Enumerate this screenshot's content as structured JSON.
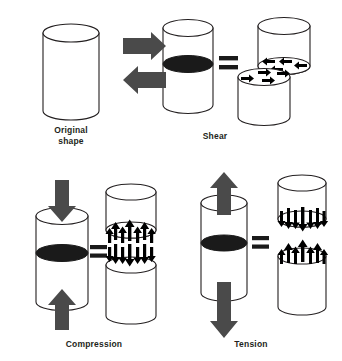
{
  "figure": {
    "title_present": false,
    "background_color": "#ffffff",
    "colors": {
      "outline": "#231f20",
      "fill_cylinder": "#ffffff",
      "stress_plane": "#1a1a1a",
      "load_arrow": "#4a4a4a",
      "force_arrow": "#000000",
      "equals_sign": "#1a1a1a"
    }
  },
  "labels": {
    "original": "Original\nshape",
    "shear": "Shear",
    "compression": "Compression",
    "tension": "Tension",
    "equals": "="
  },
  "panels": [
    {
      "id": "original-shape",
      "label": "Original\nshape",
      "description": "undeformed cylinder, no loads, no internal plane",
      "load_arrows": [],
      "internal_plane": false,
      "split_view": false
    },
    {
      "id": "shear",
      "label": "Shear",
      "description": "opposing horizontal loads offset vertically produce a horizontal shear plane",
      "load_arrows": [
        {
          "name": "shear-load-arrow-right",
          "direction": "right",
          "position": "upper-left-of-cylinder"
        },
        {
          "name": "shear-load-arrow-left",
          "direction": "left",
          "position": "lower-left-of-cylinder"
        }
      ],
      "internal_plane": true,
      "internal_plane_orientation": "horizontal-ellipse-mid-height",
      "split_view": true,
      "split_offset": "upper-block-shifted-right",
      "force_arrows": {
        "upper_block_face": {
          "direction": "left",
          "count": 4
        },
        "lower_block_face": {
          "direction": "right",
          "count": 4
        }
      }
    },
    {
      "id": "compression",
      "label": "Compression",
      "description": "axial loads pushing inward from both ends; internal forces push toward the plane",
      "load_arrows": [
        {
          "name": "compression-load-arrow-down",
          "direction": "down",
          "position": "top"
        },
        {
          "name": "compression-load-arrow-up",
          "direction": "up",
          "position": "bottom"
        }
      ],
      "internal_plane": true,
      "internal_plane_orientation": "horizontal-ellipse-mid-height",
      "split_view": true,
      "split_offset": "aligned",
      "force_arrows": {
        "upper_block_face": {
          "direction": "up",
          "count": 7
        },
        "lower_block_face": {
          "direction": "down",
          "count": 7
        }
      }
    },
    {
      "id": "tension",
      "label": "Tension",
      "description": "axial loads pulling outward from both ends; internal forces pull away from the plane",
      "load_arrows": [
        {
          "name": "tension-load-arrow-up",
          "direction": "up",
          "position": "top"
        },
        {
          "name": "tension-load-arrow-down",
          "direction": "down",
          "position": "bottom"
        }
      ],
      "internal_plane": true,
      "internal_plane_orientation": "horizontal-ellipse-mid-height",
      "split_view": true,
      "split_offset": "aligned",
      "force_arrows": {
        "upper_block_face": {
          "direction": "down",
          "count": 7
        },
        "lower_block_face": {
          "direction": "up",
          "count": 7
        }
      }
    }
  ]
}
